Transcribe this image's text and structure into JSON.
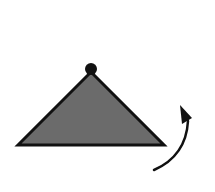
{
  "diagram": {
    "background": "#ffffff",
    "triangle": {
      "points": [
        [
          18,
          145
        ],
        [
          91,
          72
        ],
        [
          164,
          145
        ]
      ],
      "fill": "#6b6b6b",
      "stroke": "#111111",
      "stroke_width": 3
    },
    "apex_dot": {
      "cx": 91,
      "cy": 69,
      "r": 6,
      "fill": "#111111"
    },
    "rotation_arrow": {
      "path": "M154 170 Q 186 156 188 121",
      "stroke": "#111111",
      "stroke_width": 2.5,
      "head_points": [
        [
          180,
          105
        ],
        [
          192,
          118
        ],
        [
          182,
          124
        ]
      ],
      "direction": "counterclockwise-up"
    }
  }
}
